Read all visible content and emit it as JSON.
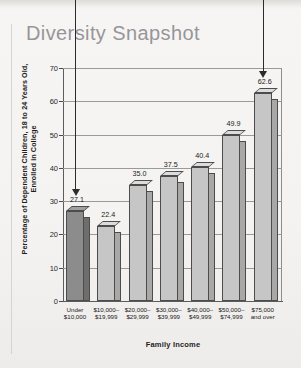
{
  "page": {
    "title": "Diversity Snapshot"
  },
  "chart_data": {
    "type": "bar",
    "title": "Diversity Snapshot",
    "xlabel": "Family Income",
    "ylabel": "Percentage of Dependent Children, 18 to 24 Years Old, Enrolled in College",
    "categories": [
      "Under\n$10,000",
      "$10,000–\n$19,999",
      "$20,000–\n$29,999",
      "$30,000–\n$39,999",
      "$40,000–\n$49,999",
      "$50,000–\n$74,999",
      "$75,000\nand over"
    ],
    "values": [
      27.1,
      22.4,
      35.0,
      37.5,
      40.4,
      49.9,
      62.6
    ],
    "data_labels": [
      "27.1",
      "22.4",
      "35.0",
      "37.5",
      "40.4",
      "49.9",
      "62.6"
    ],
    "ylim": [
      0,
      70
    ],
    "yticks": [
      0,
      10,
      20,
      30,
      40,
      50,
      60,
      70
    ],
    "ytick_labels": [
      "0",
      "10",
      "20",
      "30",
      "40",
      "50",
      "60",
      "70"
    ],
    "grid": true,
    "legend": null,
    "bar_colors": [
      "#8c8c8c",
      "#c6c6c6",
      "#c6c6c6",
      "#c6c6c6",
      "#c6c6c6",
      "#c6c6c6",
      "#c6c6c6"
    ],
    "annotations": [
      {
        "name": "arrow-to-lowest-bar",
        "target_category": "Under $10,000",
        "target_value": 27.1
      },
      {
        "name": "arrow-to-highest-bar",
        "target_category": "$75,000 and over",
        "target_value": 62.6
      }
    ]
  },
  "colors": {
    "title": "#97959a",
    "bar_dark": "#8c8c8c",
    "bar_light": "#c6c6c6",
    "axis": "#4c4c4c",
    "page_bg": "#f4f3f1"
  }
}
